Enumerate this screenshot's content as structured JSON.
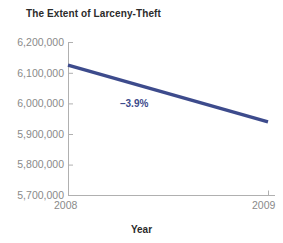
{
  "chart_data": {
    "type": "line",
    "title": "The Extent of Larceny-Theft",
    "xlabel": "Year",
    "ylabel": "",
    "x": [
      "2008",
      "2009"
    ],
    "xtick_labels": [
      "2008",
      "2009"
    ],
    "values": [
      6125000,
      5940000
    ],
    "series": [
      {
        "name": "Larceny-Theft",
        "values": [
          6125000,
          5940000
        ],
        "color": "#3d4b8c"
      }
    ],
    "ytick_labels": [
      "6,200,000",
      "6,100,000",
      "6,000,000",
      "5,900,000",
      "5,800,000",
      "5,700,000"
    ],
    "ytick_values": [
      6200000,
      6100000,
      6000000,
      5900000,
      5800000,
      5700000
    ],
    "ylim": [
      5700000,
      6200000
    ],
    "xlim": [
      2008,
      2009
    ],
    "grid": false,
    "legend": false,
    "annotations": [
      {
        "text": "–3.9%",
        "color": "#3d4b8c",
        "x": 2008.45,
        "y": 6010000
      }
    ]
  },
  "style": {
    "line_color": "#3d4b8c",
    "axis_color": "#b0b0b0",
    "tick_label_color": "#8a8a8a",
    "title_color": "#2b2b2b",
    "background": "#ffffff"
  }
}
